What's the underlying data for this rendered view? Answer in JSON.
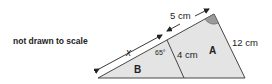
{
  "note": "not drawn to scale",
  "labels": {
    "x": "x",
    "top_segment": "5 cm",
    "angle": "65°",
    "inner_side": "4 cm",
    "outer_side": "12 cm",
    "region_A": "A",
    "region_B": "B"
  },
  "colors": {
    "fill": "#e4e4e4",
    "stroke": "#333333",
    "angle_marker": "#9a9a9a"
  }
}
